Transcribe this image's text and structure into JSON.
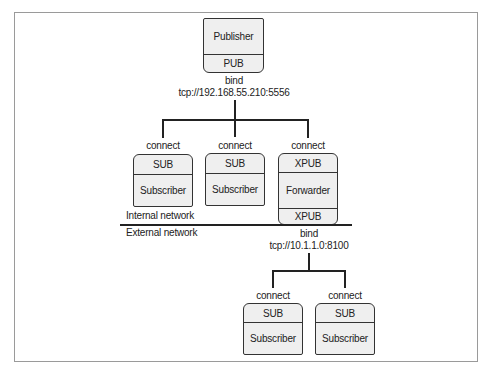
{
  "diagram": {
    "publisher": {
      "name": "Publisher",
      "socket": "PUB"
    },
    "publisher_bind": {
      "action": "bind",
      "endpoint": "tcp://192.168.55.210:5556"
    },
    "internal_nodes": [
      {
        "connect": "connect",
        "socket": "SUB",
        "name": "Subscriber"
      },
      {
        "connect": "connect",
        "socket": "SUB",
        "name": "Subscriber"
      },
      {
        "connect": "connect",
        "socket_top": "XPUB",
        "name": "Forwarder",
        "socket_bottom": "XPUB"
      }
    ],
    "network_labels": {
      "internal": "Internal network",
      "external": "External network"
    },
    "forwarder_bind": {
      "action": "bind",
      "endpoint": "tcp://10.1.1.0:8100"
    },
    "external_nodes": [
      {
        "connect": "connect",
        "socket": "SUB",
        "name": "Subscriber"
      },
      {
        "connect": "connect",
        "socket": "SUB",
        "name": "Subscriber"
      }
    ],
    "colors": {
      "box_fill": "#efefef",
      "stroke": "#333333",
      "frame": "#9a9a9a"
    }
  }
}
